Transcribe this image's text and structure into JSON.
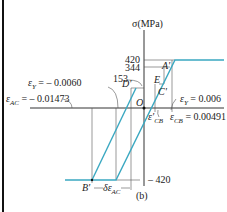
{
  "figure": {
    "caption": "(b)",
    "axis_y_label": "σ(MPa)",
    "stress_ticks": [
      "420",
      "344",
      "153",
      "– 420"
    ],
    "points": {
      "A": "A'",
      "B": "B'",
      "C": "C'",
      "D": "D'",
      "E": "E",
      "O": "O"
    },
    "annotations": {
      "eps_y_neg_sym": "ε",
      "eps_y_neg_sub": "Y",
      "eps_y_neg_val": " = – 0.0060",
      "eps_ac_sym": "ε",
      "eps_ac_sub": "AC",
      "eps_ac_val": " = – 0.01473",
      "eps_y_pos_sym": "ε",
      "eps_y_pos_sub": "Y",
      "eps_y_pos_val": " = 0.006",
      "eps_cb_prime_sym": "ε′",
      "eps_cb_prime_sub": "CB",
      "eps_cb_sym": "ε",
      "eps_cb_sub": "CB",
      "eps_cb_val": " = 0.00491",
      "delta_eps_sym": "δε",
      "delta_eps_sub": "AC"
    },
    "colors": {
      "curve": "#3aa8c1",
      "axes": "#333333",
      "border": "#111111"
    }
  }
}
